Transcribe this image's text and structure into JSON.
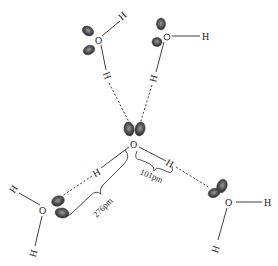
{
  "diagram": {
    "atoms": {
      "oxygen": "O",
      "hydrogen": "H"
    },
    "molecules": [
      {
        "id": "top-left",
        "O": [
          99,
          40
        ],
        "H_covalent": [
          123,
          18
        ],
        "H_bonding": [
          107,
          75
        ]
      },
      {
        "id": "top-right",
        "O": [
          167,
          37
        ],
        "H_covalent": [
          207,
          37
        ],
        "H_bonding": [
          154,
          77
        ]
      },
      {
        "id": "center",
        "O": [
          134,
          144
        ],
        "H_left": [
          98,
          172
        ],
        "H_right": [
          170,
          163
        ]
      },
      {
        "id": "bottom-left",
        "O": [
          43,
          210
        ],
        "H_a": [
          14,
          190
        ],
        "H_b": [
          34,
          252
        ]
      },
      {
        "id": "bottom-right",
        "O": [
          229,
          202
        ],
        "H_a": [
          268,
          202
        ],
        "H_b": [
          216,
          248
        ]
      }
    ],
    "measurements": {
      "oh_bond_length": "101pm",
      "o_o_distance": "276pm"
    },
    "colors": {
      "background": "#ffffff",
      "line": "#2a2a2a",
      "lobe": "#555555"
    }
  }
}
